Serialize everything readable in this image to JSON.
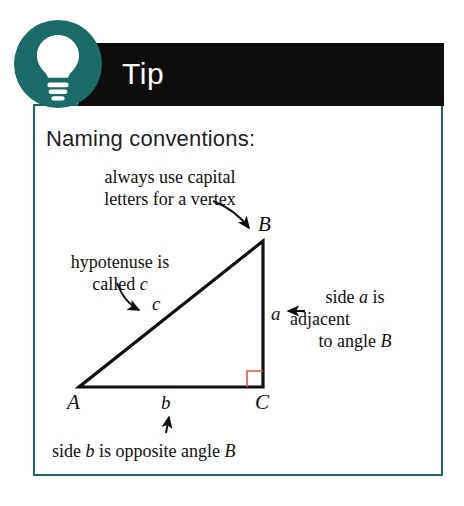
{
  "card": {
    "badge_icon": "lightbulb-icon",
    "banner_label": "Tip",
    "heading": "Naming conventions:",
    "colors": {
      "teal": "#1b6b69",
      "banner_black": "#0e0d0c",
      "ink": "#110f0e",
      "right_angle_red": "#e0573f"
    }
  },
  "annotations": {
    "vertex_note": {
      "line1": "always use capital",
      "line2": "letters for a vertex",
      "pointer": "curved-arrow-to-vertex-B"
    },
    "hypotenuse_note": {
      "line1": "hypotenuse is",
      "line2_prefix": "called ",
      "line2_italic": "c",
      "pointer": "curved-arrow-to-side-c"
    },
    "adjacent_note": {
      "line1_prefix": "side ",
      "line1_italic": "a",
      "line1_suffix": " is",
      "line2": "adjacent",
      "line3_prefix": "to angle ",
      "line3_italic": "B",
      "pointer": "left-arrow-to-side-a"
    },
    "opposite_note": {
      "prefix": "side ",
      "italic1": "b",
      "middle": " is opposite angle ",
      "italic2": "B",
      "pointer": "up-arrow-to-side-b"
    }
  },
  "triangle": {
    "vertices": [
      {
        "name": "A",
        "label": "A"
      },
      {
        "name": "B",
        "label": "B"
      },
      {
        "name": "C",
        "label": "C"
      }
    ],
    "sides": [
      {
        "name": "a",
        "label": "a"
      },
      {
        "name": "b",
        "label": "b"
      },
      {
        "name": "c",
        "label": "c"
      }
    ],
    "right_angle_at": "C"
  }
}
